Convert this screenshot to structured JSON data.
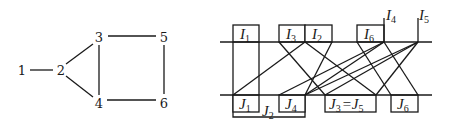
{
  "graph": {
    "nodes": [
      {
        "id": "1",
        "label": "1",
        "x": 22,
        "y": 70
      },
      {
        "id": "2",
        "label": "2",
        "x": 61,
        "y": 70
      },
      {
        "id": "3",
        "label": "3",
        "x": 99,
        "y": 37
      },
      {
        "id": "4",
        "label": "4",
        "x": 99,
        "y": 103
      },
      {
        "id": "5",
        "label": "5",
        "x": 164,
        "y": 37
      },
      {
        "id": "6",
        "label": "6",
        "x": 164,
        "y": 103
      }
    ],
    "edges": [
      [
        "1",
        "2"
      ],
      [
        "2",
        "3"
      ],
      [
        "2",
        "4"
      ],
      [
        "3",
        "4"
      ],
      [
        "3",
        "5"
      ],
      [
        "4",
        "6"
      ],
      [
        "5",
        "6"
      ]
    ]
  },
  "interval_diagram": {
    "top_line": {
      "x1": 220,
      "x2": 432,
      "y": 42
    },
    "bottom_line": {
      "x1": 220,
      "x2": 432,
      "y": 95
    },
    "top_boxes": [
      {
        "name": "I",
        "sub": "1",
        "x1": 233,
        "x2": 259
      },
      {
        "name": "I",
        "sub": "3",
        "x1": 279,
        "x2": 305
      },
      {
        "name": "I",
        "sub": "2",
        "x1": 305,
        "x2": 332
      },
      {
        "name": "I",
        "sub": "6",
        "x1": 357,
        "x2": 384
      }
    ],
    "top_points": [
      {
        "name": "I",
        "sub": "4",
        "x": 384
      },
      {
        "name": "I",
        "sub": "5",
        "x": 418
      }
    ],
    "bottom_boxes": [
      {
        "name": "J",
        "sub": "1",
        "x1": 233,
        "x2": 259
      },
      {
        "name": "J",
        "sub": "4",
        "x1": 279,
        "x2": 305
      },
      {
        "name": "J",
        "sub": "3",
        "extra": "= J5",
        "x1": 325,
        "x2": 376
      },
      {
        "name": "J",
        "sub": "6",
        "x1": 391,
        "x2": 418
      }
    ],
    "bracket": {
      "name": "J",
      "sub": "2",
      "x1": 233,
      "x2": 305
    },
    "connections": [
      [
        233,
        233
      ],
      [
        259,
        259
      ],
      [
        305,
        233
      ],
      [
        279,
        325
      ],
      [
        305,
        376
      ],
      [
        332,
        305
      ],
      [
        357,
        391
      ],
      [
        384,
        279
      ],
      [
        384,
        305
      ],
      [
        384,
        418
      ],
      [
        418,
        305
      ],
      [
        418,
        325
      ],
      [
        418,
        376
      ]
    ]
  }
}
